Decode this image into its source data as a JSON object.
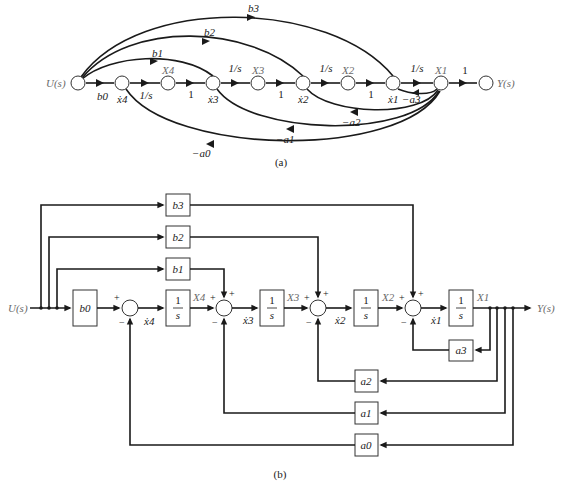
{
  "diagram_a": {
    "caption": "(a)",
    "input_label": "U(s)",
    "output_label": "Y(s)",
    "nodes": [
      {
        "id": "U",
        "label": "U(s)"
      },
      {
        "id": "x4d",
        "label": "ẋ4"
      },
      {
        "id": "X4",
        "label": "X4"
      },
      {
        "id": "x3d",
        "label": "ẋ3"
      },
      {
        "id": "X3",
        "label": "X3"
      },
      {
        "id": "x2d",
        "label": "ẋ2"
      },
      {
        "id": "X2",
        "label": "X2"
      },
      {
        "id": "x1d",
        "label": "ẋ1"
      },
      {
        "id": "X1",
        "label": "X1"
      },
      {
        "id": "Y",
        "label": "Y(s)"
      }
    ],
    "forward_gains": [
      {
        "from": "U",
        "to": "x4d",
        "gain": "b0"
      },
      {
        "from": "x4d",
        "to": "X4",
        "gain": "1/s"
      },
      {
        "from": "X4",
        "to": "x3d",
        "gain": "1"
      },
      {
        "from": "x3d",
        "to": "X3",
        "gain": "1/s"
      },
      {
        "from": "X3",
        "to": "x2d",
        "gain": "1"
      },
      {
        "from": "x2d",
        "to": "X2",
        "gain": "1/s"
      },
      {
        "from": "X2",
        "to": "x1d",
        "gain": "1"
      },
      {
        "from": "x1d",
        "to": "X1",
        "gain": "1/s"
      },
      {
        "from": "X1",
        "to": "Y",
        "gain": "1"
      }
    ],
    "feedforward": [
      {
        "from": "U",
        "to": "x3d",
        "gain": "b1"
      },
      {
        "from": "U",
        "to": "x2d",
        "gain": "b2"
      },
      {
        "from": "U",
        "to": "x1d",
        "gain": "b3"
      }
    ],
    "feedback": [
      {
        "from": "X1",
        "to": "x1d",
        "gain": "−a3"
      },
      {
        "from": "X1",
        "to": "x2d",
        "gain": "−a2"
      },
      {
        "from": "X1",
        "to": "x3d",
        "gain": "−a1"
      },
      {
        "from": "X1",
        "to": "x4d",
        "gain": "−a0"
      }
    ]
  },
  "diagram_b": {
    "caption": "(b)",
    "input_label": "U(s)",
    "output_label": "Y(s)",
    "blocks": {
      "b0": "b0",
      "b1": "b1",
      "b2": "b2",
      "b3": "b3",
      "a0": "a0",
      "a1": "a1",
      "a2": "a2",
      "a3": "a3",
      "integrator": "1/s"
    },
    "signals": [
      "ẋ4",
      "X4",
      "ẋ3",
      "X3",
      "ẋ2",
      "X2",
      "ẋ1",
      "X1"
    ],
    "sum_signs": {
      "plus": "+",
      "minus": "−"
    }
  }
}
